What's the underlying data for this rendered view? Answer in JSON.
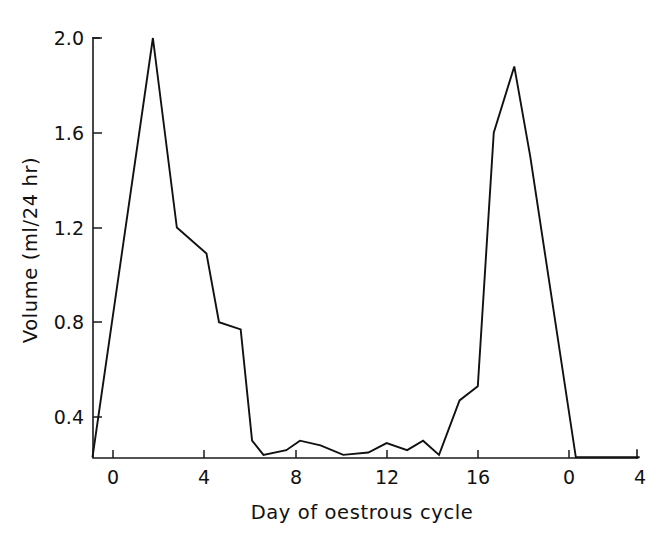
{
  "chart_data": {
    "type": "line",
    "title": "",
    "subtitle": "",
    "xlabel": "Day of oestrous cycle",
    "ylabel": "Volume (ml/24 hr)",
    "xlim": [
      -1.0,
      4.0
    ],
    "ylim": [
      0.0,
      2.0
    ],
    "x_tick_values": [
      0,
      4,
      8,
      12,
      16,
      20,
      24
    ],
    "x_tick_labels": [
      "0",
      "4",
      "8",
      "12",
      "16",
      "0",
      "4"
    ],
    "y_tick_values": [
      0.4,
      0.8,
      1.2,
      1.6,
      2.0
    ],
    "y_tick_labels": [
      "0.4",
      "0.8",
      "1.2",
      "1.6",
      "2.0"
    ],
    "grid": false,
    "legend": "none",
    "series": [
      {
        "name": "Volume",
        "x": [
          -0.9,
          1.75,
          2.8,
          4.1,
          4.65,
          5.6,
          6.1,
          6.6,
          7.6,
          8.2,
          9.1,
          10.1,
          11.2,
          12.0,
          12.9,
          13.6,
          14.3,
          15.2,
          16.0,
          16.7,
          17.6,
          18.3,
          20.3,
          21.2,
          22.8,
          23.1
        ],
        "y": [
          0.23,
          2.0,
          1.2,
          1.09,
          0.8,
          0.77,
          0.3,
          0.24,
          0.26,
          0.3,
          0.28,
          0.24,
          0.25,
          0.29,
          0.26,
          0.3,
          0.24,
          0.47,
          0.53,
          1.6,
          1.88,
          1.5,
          0.23,
          0.23,
          0.23,
          0.23
        ]
      }
    ]
  },
  "axes": {
    "y_title": "Volume (ml/24 hr)",
    "x_title": "Day of oestrous cycle",
    "line_color": "#111111",
    "background_color": "#ffffff"
  }
}
